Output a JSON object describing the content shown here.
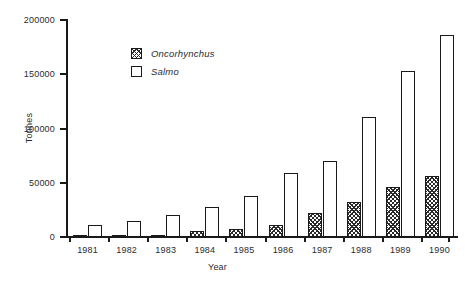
{
  "chart_data": {
    "type": "bar",
    "title": "",
    "subtitle": "",
    "xlabel": "Year",
    "ylabel": "Tonnes",
    "categories": [
      "1981",
      "1982",
      "1983",
      "1984",
      "1985",
      "1986",
      "1987",
      "1988",
      "1989",
      "1990"
    ],
    "series": [
      {
        "name": "Oncorhynchus",
        "fill": "hatched",
        "values": [
          300,
          1500,
          2000,
          5500,
          7000,
          11500,
          22000,
          32000,
          46000,
          56000
        ]
      },
      {
        "name": "Salmo",
        "fill": "white",
        "values": [
          11000,
          14500,
          20500,
          27500,
          38000,
          59000,
          70000,
          111000,
          153000,
          186000
        ]
      }
    ],
    "ylim": [
      0,
      200000
    ],
    "yticks": [
      0,
      50000,
      100000,
      150000,
      200000
    ],
    "ytick_labels": [
      "0",
      "50000",
      "100000",
      "150000",
      "200000"
    ],
    "grid": false,
    "legend_position": "upper-left-inside",
    "axis_color": "#1a1a1a",
    "text_color": "#2b2b2b",
    "background": "#ffffff"
  },
  "legend": {
    "entries": [
      {
        "label": "Oncorhynchus",
        "swatch": "hatched-square-icon"
      },
      {
        "label": "Salmo",
        "swatch": "empty-square-icon"
      }
    ]
  },
  "axes": {
    "y_title": "Tonnes",
    "x_title": "Year"
  }
}
